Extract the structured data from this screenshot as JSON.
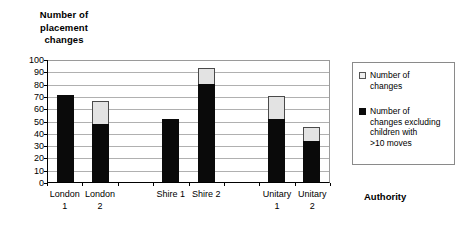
{
  "chart_data": {
    "type": "bar",
    "title": "",
    "ylabel": "Number of placement changes",
    "xlabel": "Authority",
    "ylim": [
      0,
      100
    ],
    "ytick_labels": [
      "100",
      "90",
      "80",
      "70",
      "60",
      "50",
      "40",
      "30",
      "20",
      "10",
      "0"
    ],
    "ytick_values": [
      100,
      90,
      80,
      70,
      60,
      50,
      40,
      30,
      20,
      10,
      0
    ],
    "grid": true,
    "legend_position": "right",
    "stacked": true,
    "categories": [
      "London 1",
      "London 2",
      "",
      "Shire 1",
      "Shire 2",
      "",
      "Unitary 1",
      "Unitary 2"
    ],
    "category_lines": [
      [
        "London",
        "1"
      ],
      [
        "London",
        "2"
      ],
      [
        "",
        ""
      ],
      [
        "Shire 1",
        ""
      ],
      [
        "Shire 2",
        ""
      ],
      [
        "",
        ""
      ],
      [
        "Unitary",
        "1"
      ],
      [
        "Unitary",
        "2"
      ]
    ],
    "series": [
      {
        "name": "Number of changes",
        "color": "#e3e3e3",
        "values": [
          71,
          66,
          null,
          51,
          93,
          null,
          70,
          45
        ]
      },
      {
        "name": "Number of changes excluding children with >10 moves",
        "color": "#0a0a0a",
        "values": [
          71,
          47,
          null,
          51,
          80,
          null,
          51,
          33
        ]
      }
    ]
  },
  "axis_titles": {
    "y_line1": "Number of",
    "y_line2": "placement",
    "y_line3": "changes",
    "x": "Authority"
  },
  "legend": {
    "items": [
      {
        "swatch": "light-square-swatch",
        "line1": "Number of",
        "line2": "changes",
        "line3": "",
        "line4": ""
      },
      {
        "swatch": "dark-square-swatch",
        "line1": "Number of",
        "line2": "changes excluding",
        "line3": "children with",
        "line4": ">10 moves"
      }
    ]
  }
}
